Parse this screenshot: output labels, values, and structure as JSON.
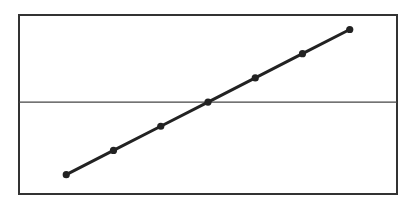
{
  "chart_data": {
    "type": "line",
    "title": "",
    "xlabel": "",
    "ylabel": "",
    "x": [
      1,
      2,
      3,
      4,
      5,
      6,
      7
    ],
    "series": [
      {
        "name": "",
        "values": [
          -3,
          -2,
          -1,
          0,
          1,
          2,
          3
        ]
      }
    ],
    "xlim": [
      0,
      8
    ],
    "ylim": [
      -3.8,
      3.6
    ],
    "reference_line_y": 0,
    "grid": false,
    "legend": "none",
    "markers": true
  },
  "colors": {
    "line": "#222222",
    "frame": "#333333",
    "reference_line": "#444444",
    "background": "#ffffff"
  }
}
